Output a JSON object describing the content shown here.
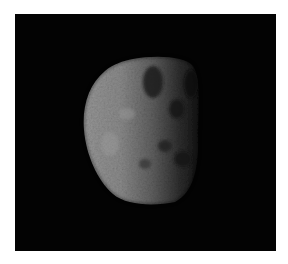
{
  "image": {
    "subject": "irregular moon / asteroid body, partially illuminated",
    "colors": {
      "page_background": "#ffffff",
      "space_background": "#030303",
      "lit_surface": "#8c8c8c",
      "highlight": "#a6a6a6",
      "terminator_shadow": "#2a2a2a"
    },
    "frame": {
      "x": 15,
      "y": 14,
      "width": 261,
      "height": 237
    },
    "body_bounds": {
      "x_min": 84,
      "x_max": 200,
      "y_min": 58,
      "y_max": 204
    }
  }
}
